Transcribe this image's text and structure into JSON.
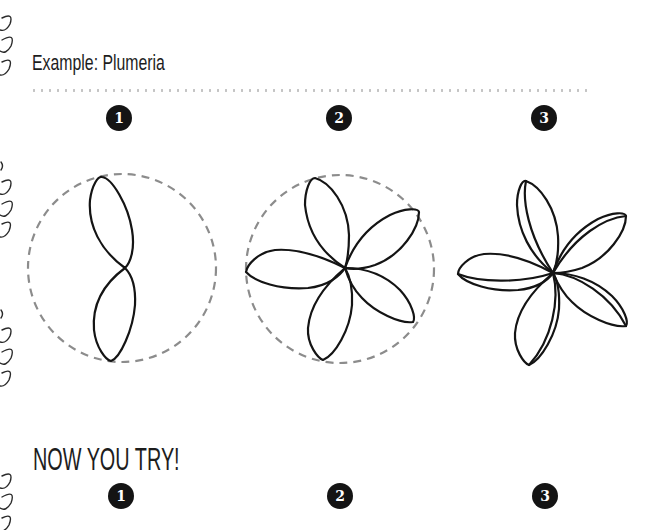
{
  "example": {
    "title": "Example: Plumeria",
    "steps": [
      {
        "number": "1",
        "description": "Two-petal outline inside dashed circle guide"
      },
      {
        "number": "2",
        "description": "Five-petal outline inside dashed circle guide"
      },
      {
        "number": "3",
        "description": "Finished plumeria with folded petal edges"
      }
    ]
  },
  "practice": {
    "title": "NOW YOU TRY!",
    "steps": [
      {
        "number": "1"
      },
      {
        "number": "2"
      },
      {
        "number": "3"
      }
    ]
  },
  "colors": {
    "ink": "#141414",
    "guide": "#8c8c8c",
    "dots": "#c4c4c4"
  }
}
